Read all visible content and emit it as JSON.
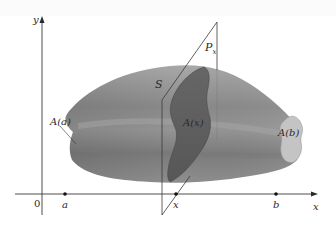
{
  "figure": {
    "type": "solid-volume-by-cross-sections",
    "axes": {
      "y_label": "y",
      "x_label": "x",
      "origin_label": "0"
    },
    "points_on_x_axis": [
      {
        "label": "a",
        "x": 65
      },
      {
        "label": "x",
        "x": 176
      },
      {
        "label": "b",
        "x": 276
      }
    ],
    "labels": {
      "solid": "S",
      "plane": "P",
      "plane_subscript": "x",
      "cross_section_x": "A(x)",
      "cross_section_a": "A(a)",
      "cross_section_b": "A(b)"
    },
    "colors": {
      "background": "#ffffff",
      "solid_light": "#b4b4b4",
      "solid_mid": "#8e8e8e",
      "solid_dark": "#6e6e6e",
      "cross_section": "#5f5f5f",
      "end_face": "#c6c6c6",
      "plane_line": "#3a3a3a",
      "axis": "#3a3a3a"
    }
  }
}
